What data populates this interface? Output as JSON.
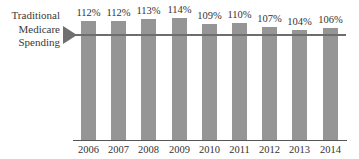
{
  "chart_data": {
    "type": "bar",
    "title": "",
    "annotation": "Traditional Medicare Spending",
    "reference_line": {
      "value": 100,
      "label": "Traditional Medicare Spending"
    },
    "categories": [
      "2006",
      "2007",
      "2008",
      "2009",
      "2010",
      "2011",
      "2012",
      "2013",
      "2014"
    ],
    "values": [
      112,
      112,
      113,
      114,
      109,
      110,
      107,
      104,
      106
    ],
    "value_labels": [
      "112%",
      "112%",
      "113%",
      "114%",
      "109%",
      "110%",
      "107%",
      "104%",
      "106%"
    ],
    "xlabel": "",
    "ylabel": "",
    "bar_color": "#959595",
    "grid": false
  },
  "labels": {
    "line1": "Traditional",
    "line2": "Medicare",
    "line3": "Spending"
  }
}
